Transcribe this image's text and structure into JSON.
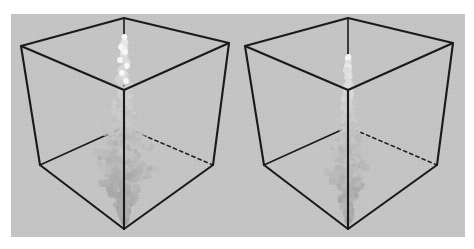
{
  "figure": {
    "title": "",
    "caption": "",
    "background_color": "#ffffff",
    "panel_color": "#c9c9c9",
    "edge_color": "#1a1a1a",
    "particle_dark_color": "#8f8f8f",
    "particle_mid_color": "#a8a8a8",
    "particle_light_color": "#f2f2f2",
    "panel_count": "2"
  },
  "chart_data": {
    "type": "scatter",
    "title": "",
    "subtitle": "",
    "xlabel": "",
    "ylabel": "",
    "zlabel": "",
    "grid": "off",
    "legend": "none",
    "projection": "3d-cube-wireframe",
    "axis_ranges": {
      "x": [
        0,
        1
      ],
      "y": [
        0,
        1
      ],
      "z": [
        0,
        1
      ]
    },
    "panels": [
      {
        "name": "left-panel",
        "label": "",
        "cube": {
          "top_back": [
            124,
            18
          ],
          "top_left": [
            21,
            46
          ],
          "top_right": [
            229,
            43
          ],
          "top_front": [
            124,
            90
          ],
          "bottom_back": [
            124,
            127
          ],
          "bottom_left": [
            40,
            165
          ],
          "bottom_right": [
            213,
            165
          ],
          "bottom_front": [
            124,
            229
          ]
        },
        "plume": {
          "description": "vertical particle plume along back vertical edge, bright sparse particles at top, dense gray cloud in lower half, converging to bottom vertex",
          "top_y": 36,
          "bottom_y": 226,
          "max_width": 62,
          "max_width_y": 168,
          "particle_count": 520,
          "brightness_top": 0.95,
          "brightness_bottom": 0.42,
          "spread": "wide"
        }
      },
      {
        "name": "right-panel",
        "label": "",
        "cube": {
          "top_back": [
            348,
            18
          ],
          "top_left": [
            245,
            46
          ],
          "top_right": [
            453,
            43
          ],
          "top_front": [
            348,
            90
          ],
          "bottom_back": [
            348,
            127
          ],
          "bottom_left": [
            264,
            165
          ],
          "bottom_right": [
            437,
            165
          ],
          "bottom_front": [
            348,
            229
          ]
        },
        "plume": {
          "description": "vertical particle plume, narrower and more concentrated than left panel, single bright particle near top vertex",
          "top_y": 56,
          "bottom_y": 226,
          "max_width": 42,
          "max_width_y": 172,
          "particle_count": 430,
          "brightness_top": 0.95,
          "brightness_bottom": 0.42,
          "spread": "narrow"
        }
      }
    ]
  }
}
